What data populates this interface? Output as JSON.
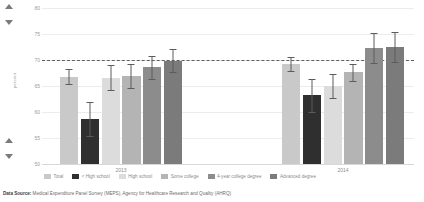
{
  "controls": {
    "scroll_up_top": "▲",
    "scroll_down_top": "▼",
    "scroll_up_bottom": "▲",
    "scroll_down_bottom": "▼"
  },
  "footer": {
    "label": "Data Source:",
    "text": " Medical Expenditure Panel Survey (MEPS), Agency for Healthcare Research and Quality (AHRQ)"
  },
  "chart_data": {
    "type": "bar",
    "title": "",
    "xlabel": "",
    "ylabel": "percent",
    "ylim": [
      50,
      80
    ],
    "yticks": [
      80,
      75,
      70,
      65,
      60,
      55,
      50
    ],
    "ytick_labels": [
      "80",
      "75",
      "70",
      "65",
      "60",
      "55",
      "50"
    ],
    "grid": true,
    "legend_position": "bottom",
    "categories": [
      "2013",
      "2014"
    ],
    "reference_line": {
      "value": 70,
      "style": "dashed",
      "color": "#5f5f5f"
    },
    "series": [
      {
        "name": "Total",
        "color": "#c9c9c9",
        "values": [
          66.8,
          69.2
        ],
        "err_low": [
          65.4,
          67.9
        ],
        "err_high": [
          68.2,
          70.5
        ]
      },
      {
        "name": "< High school",
        "color": "#2f2f2f",
        "values": [
          58.7,
          63.2
        ],
        "err_low": [
          55.4,
          60.0
        ],
        "err_high": [
          62.0,
          66.4
        ]
      },
      {
        "name": "High school",
        "color": "#dcdcdc",
        "values": [
          66.6,
          65.0
        ],
        "err_low": [
          64.2,
          62.6
        ],
        "err_high": [
          69.0,
          67.4
        ]
      },
      {
        "name": "Some college",
        "color": "#b4b4b4",
        "values": [
          66.9,
          67.6
        ],
        "err_low": [
          64.6,
          65.9
        ],
        "err_high": [
          69.2,
          69.3
        ]
      },
      {
        "name": "4-year college degree",
        "color": "#8c8c8c",
        "values": [
          68.6,
          72.3
        ],
        "err_low": [
          66.4,
          69.4
        ],
        "err_high": [
          70.8,
          75.2
        ]
      },
      {
        "name": "Advanced degree",
        "color": "#7b7b7b",
        "values": [
          69.9,
          72.5
        ],
        "err_low": [
          67.6,
          69.6
        ],
        "err_high": [
          72.2,
          75.4
        ]
      }
    ]
  }
}
